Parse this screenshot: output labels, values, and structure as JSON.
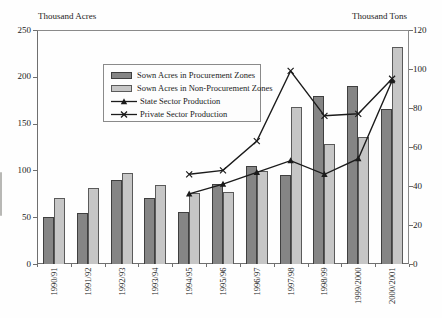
{
  "chart_data": {
    "type": "bar+line combo, dual y-axes",
    "categories": [
      "1990/91",
      "1991/92",
      "1992/93",
      "1993/94",
      "1994/95",
      "1995/96",
      "1996/97",
      "1997/98",
      "1998/99",
      "1999/2000",
      "2000/2001"
    ],
    "left_axis": {
      "title": "Thousand Acres",
      "min": 0,
      "max": 250,
      "step": 50
    },
    "right_axis": {
      "title": "Thousand Tons",
      "min": 0,
      "max": 120,
      "step": 20
    },
    "grid": false,
    "legend_position": "inside-top-left",
    "series": [
      {
        "name": "Sown Acres in Procurement Zones",
        "type": "bar",
        "axis": "left",
        "color": "#858585",
        "border": "#3f3f3f",
        "values": [
          50,
          55,
          90,
          70,
          56,
          85,
          105,
          95,
          180,
          190,
          166
        ]
      },
      {
        "name": "Sown Acres in Non-Procurement Zones",
        "type": "bar",
        "axis": "left",
        "color": "#c6c6c6",
        "border": "#5a5a5a",
        "values": [
          70,
          81,
          97,
          84,
          76,
          77,
          99,
          168,
          128,
          136,
          232
        ]
      },
      {
        "name": "State Sector Production",
        "type": "line",
        "axis": "right",
        "marker": "triangle",
        "color": "#1b1b1b",
        "values": [
          null,
          null,
          null,
          null,
          36,
          41,
          47,
          53,
          46,
          54,
          94
        ]
      },
      {
        "name": "Private Sector Production",
        "type": "line",
        "axis": "right",
        "marker": "x",
        "color": "#1b1b1b",
        "values": [
          null,
          null,
          null,
          null,
          46,
          48,
          63,
          99,
          76,
          77,
          95
        ]
      }
    ]
  }
}
